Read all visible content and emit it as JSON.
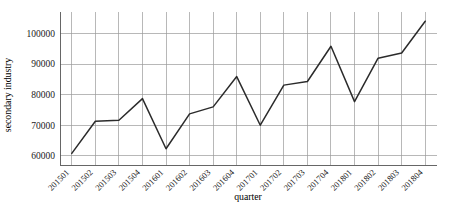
{
  "chart_data": {
    "type": "line",
    "title": "",
    "xlabel": "quarter",
    "ylabel": "secondary industry",
    "categories": [
      "201501",
      "201502",
      "201503",
      "201504",
      "201601",
      "201602",
      "201603",
      "201604",
      "201701",
      "201702",
      "201703",
      "201704",
      "201801",
      "201802",
      "201803",
      "201804"
    ],
    "values": [
      60800,
      71300,
      71600,
      78700,
      62300,
      73700,
      76000,
      85900,
      70000,
      83100,
      84300,
      95800,
      77700,
      91900,
      93600,
      104000
    ],
    "series": [
      {
        "name": "secondary industry",
        "values": [
          60800,
          71300,
          71600,
          78700,
          62300,
          73700,
          76000,
          85900,
          70000,
          83100,
          84300,
          95800,
          77700,
          91900,
          93600,
          104000
        ]
      }
    ],
    "ylim": [
      57000,
      107000
    ],
    "yticks": [
      60000,
      70000,
      80000,
      90000,
      100000
    ],
    "ytick_labels": [
      "60000",
      "70000",
      "80000",
      "90000",
      "100000"
    ],
    "grid": true,
    "legend": "none",
    "line_color": "#2b2b2b",
    "grid_color": "#9a9a9a"
  }
}
